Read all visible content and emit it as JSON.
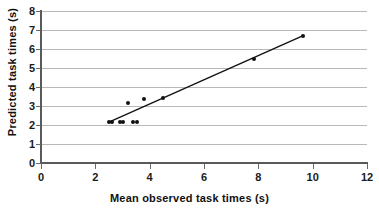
{
  "chart_data": {
    "type": "scatter",
    "title": "",
    "xlabel": "Mean observed task times (s)",
    "ylabel": "Predicted task times (s)",
    "xlim": [
      0,
      12
    ],
    "ylim": [
      0,
      8
    ],
    "xticks": [
      0,
      2,
      4,
      6,
      8,
      10,
      12
    ],
    "yticks": [
      0,
      1,
      2,
      3,
      4,
      5,
      6,
      7,
      8
    ],
    "xtick_labels": [
      "0",
      "2",
      "4",
      "6",
      "8",
      "10",
      "12"
    ],
    "ytick_labels": [
      "0",
      "1",
      "2",
      "3",
      "4",
      "5",
      "6",
      "7",
      "8"
    ],
    "grid": "horizontal",
    "legend": "none",
    "grid_color": "#b8b8b8",
    "marker_color": "#111111",
    "line_color": "#111111",
    "points": [
      {
        "x": 2.5,
        "y": 2.15
      },
      {
        "x": 2.62,
        "y": 2.15
      },
      {
        "x": 2.9,
        "y": 2.15
      },
      {
        "x": 3.02,
        "y": 2.15
      },
      {
        "x": 3.4,
        "y": 2.15
      },
      {
        "x": 3.55,
        "y": 2.15
      },
      {
        "x": 3.2,
        "y": 3.15
      },
      {
        "x": 3.78,
        "y": 3.35
      },
      {
        "x": 4.5,
        "y": 3.4
      },
      {
        "x": 7.85,
        "y": 5.5
      },
      {
        "x": 9.65,
        "y": 6.7
      }
    ],
    "trend_line": {
      "x1": 2.5,
      "y1": 2.15,
      "x2": 9.65,
      "y2": 6.7
    }
  }
}
